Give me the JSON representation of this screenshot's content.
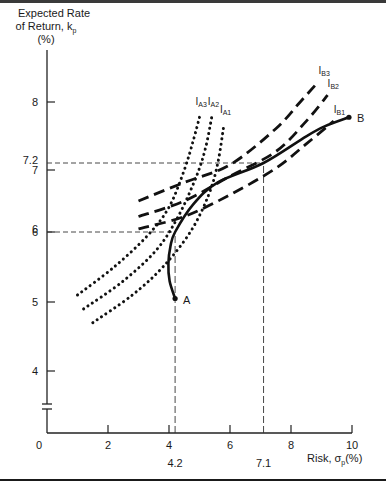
{
  "chart_data": {
    "type": "line",
    "title": "",
    "ylabel_lines": [
      "Expected Rate",
      "of Return, k",
      "(%)"
    ],
    "ylabel_subscript": "p",
    "xlabel_prefix": "Risk, σ",
    "xlabel_subscript": "p",
    "xlabel_suffix": "(%)",
    "xlim": [
      0,
      10
    ],
    "ylim": [
      0,
      8.5
    ],
    "y_axis_break": true,
    "origin_label": "0",
    "x_ticks": [
      2,
      4,
      6,
      8,
      10
    ],
    "x_tick_labels": [
      "2",
      "4",
      "6",
      "8",
      "10"
    ],
    "y_ticks": [
      4,
      5,
      6,
      7,
      8
    ],
    "y_tick_labels": [
      "4",
      "5",
      "6",
      "7",
      "8"
    ],
    "grid": false,
    "reference_lines": [
      {
        "axis": "y",
        "value": 7.2,
        "label": "7.2",
        "to_x": 7.1
      },
      {
        "axis": "y",
        "value": 6.0,
        "label": "6",
        "to_x": 4.2
      },
      {
        "axis": "x",
        "value": 4.2,
        "label": "4.2",
        "to_y": 6.0
      },
      {
        "axis": "x",
        "value": 7.1,
        "label": "7.1",
        "to_y": 7.2
      }
    ],
    "points": [
      {
        "name": "A",
        "x": 4.2,
        "y": 5.05
      },
      {
        "name": "B",
        "x": 9.9,
        "y": 7.8
      }
    ],
    "series": [
      {
        "name": "Efficient frontier AB",
        "style": "solid",
        "x": [
          4.2,
          4.02,
          3.98,
          4.05,
          4.2,
          4.8,
          5.6,
          7.1,
          8.5,
          9.1,
          9.9
        ],
        "y": [
          5.05,
          5.3,
          5.55,
          5.8,
          6.0,
          6.45,
          6.8,
          7.2,
          7.55,
          7.68,
          7.8
        ]
      },
      {
        "name": "I",
        "sub": "A1",
        "style": "dotted",
        "x": [
          1.5,
          2.8,
          3.8,
          4.7,
          5.3,
          5.6,
          5.8
        ],
        "y": [
          4.7,
          5.1,
          5.5,
          6.0,
          6.6,
          7.2,
          7.7
        ]
      },
      {
        "name": "I",
        "sub": "A2",
        "style": "dotted",
        "x": [
          1.2,
          2.5,
          3.6,
          4.3,
          4.9,
          5.2,
          5.4
        ],
        "y": [
          4.9,
          5.3,
          5.75,
          6.25,
          6.9,
          7.4,
          7.8
        ]
      },
      {
        "name": "I",
        "sub": "A3",
        "style": "dotted",
        "x": [
          1.0,
          2.2,
          3.3,
          4.0,
          4.5,
          4.8,
          5.0
        ],
        "y": [
          5.1,
          5.5,
          5.95,
          6.4,
          7.0,
          7.5,
          7.8
        ]
      },
      {
        "name": "I",
        "sub": "B1",
        "style": "dashed",
        "x": [
          3.0,
          4.5,
          6.0,
          7.5,
          8.5,
          9.4
        ],
        "y": [
          6.05,
          6.25,
          6.6,
          7.05,
          7.45,
          7.75
        ]
      },
      {
        "name": "I",
        "sub": "B2",
        "style": "dashed",
        "x": [
          3.0,
          4.5,
          6.0,
          7.5,
          8.5,
          9.2
        ],
        "y": [
          6.25,
          6.5,
          6.9,
          7.35,
          7.75,
          8.1
        ]
      },
      {
        "name": "I",
        "sub": "B3",
        "style": "dashed",
        "x": [
          3.0,
          4.5,
          6.0,
          7.5,
          8.3,
          8.9
        ],
        "y": [
          6.5,
          6.8,
          7.15,
          7.65,
          8.0,
          8.3
        ]
      }
    ]
  }
}
